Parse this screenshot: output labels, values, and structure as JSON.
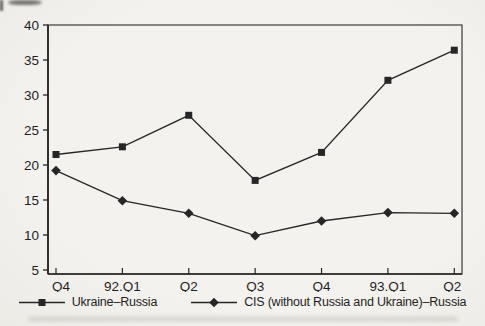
{
  "figure": {
    "background": "#f3f1ed",
    "ink": "#262626",
    "axis_color": "#3a3a3a"
  },
  "chart_data": {
    "type": "line",
    "title": "",
    "xlabel": "",
    "ylabel": "",
    "categories": [
      "Q4",
      "92.Q1",
      "Q2",
      "Q3",
      "Q4",
      "93.Q1",
      "Q2"
    ],
    "series": [
      {
        "name": "Ukraine–Russia",
        "marker": "square",
        "values": [
          21.5,
          22.6,
          27.1,
          17.8,
          21.8,
          32.1,
          36.4
        ]
      },
      {
        "name": "CIS (without Russia and Ukraine)–Russia",
        "marker": "diamond",
        "values": [
          19.2,
          14.9,
          13.1,
          9.9,
          12.0,
          13.2,
          13.1
        ]
      }
    ],
    "ylim": [
      5,
      40
    ],
    "y_ticks": [
      5,
      10,
      15,
      20,
      25,
      30,
      35,
      40
    ],
    "grid": false,
    "legend_position": "bottom"
  },
  "legend": {
    "items": [
      {
        "label": "Ukraine–Russia",
        "marker": "square"
      },
      {
        "label": "CIS (without Russia and Ukraine)–Russia",
        "marker": "diamond"
      }
    ]
  }
}
